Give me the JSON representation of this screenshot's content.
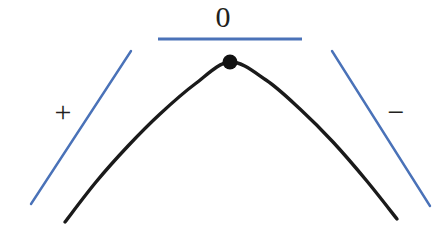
{
  "figure": {
    "background_color": "#ffffff",
    "width": 446,
    "height": 240,
    "curve_color": "#1a1a1a",
    "tangent_color": "#4a72b8",
    "point_color": "#111111",
    "label_color": "#231f20"
  },
  "labels": {
    "left_sign": "+",
    "apex_sign": "0",
    "right_sign": "−"
  },
  "chart_data": {
    "type": "line",
    "xlabel": "",
    "ylabel": "",
    "grid": false,
    "legend": "none",
    "xlim": [
      0,
      446
    ],
    "ylim": [
      240,
      0
    ],
    "series": [
      {
        "name": "curve",
        "role": "concave-down-parabola",
        "color": "#1a1a1a",
        "stroke_width": 3.4,
        "points": [
          [
            65,
            222
          ],
          [
            96,
            182
          ],
          [
            128,
            146
          ],
          [
            160,
            114
          ],
          [
            195,
            84
          ],
          [
            230,
            62
          ],
          [
            266,
            80
          ],
          [
            300,
            109
          ],
          [
            333,
            142
          ],
          [
            366,
            180
          ],
          [
            397,
            219
          ]
        ]
      },
      {
        "name": "tangent-left",
        "role": "positive-slope-tangent",
        "color": "#4a72b8",
        "stroke_width": 2.4,
        "points": [
          [
            31,
            204
          ],
          [
            131,
            51
          ]
        ],
        "slope_sign": "+",
        "label": "+"
      },
      {
        "name": "tangent-apex",
        "role": "zero-slope-tangent",
        "color": "#4a72b8",
        "stroke_width": 3.0,
        "points": [
          [
            158,
            39
          ],
          [
            302,
            39
          ]
        ],
        "slope_sign": "0",
        "label": "0"
      },
      {
        "name": "tangent-right",
        "role": "negative-slope-tangent",
        "color": "#4a72b8",
        "stroke_width": 2.4,
        "points": [
          [
            332,
            51
          ],
          [
            430,
            206
          ]
        ],
        "slope_sign": "−",
        "label": "−"
      }
    ],
    "annotations": [
      {
        "name": "maximum-point",
        "x": 230,
        "y": 62,
        "marker": "filled-circle",
        "radius": 7.5,
        "color": "#111111"
      },
      {
        "name": "plus-label",
        "x": 62,
        "y": 113,
        "text": "+"
      },
      {
        "name": "zero-label",
        "x": 229,
        "y": 19,
        "text": "0"
      },
      {
        "name": "minus-label",
        "x": 396,
        "y": 113,
        "text": "−"
      }
    ]
  }
}
